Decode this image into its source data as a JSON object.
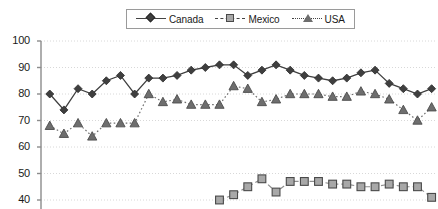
{
  "legend": {
    "position": "top-center",
    "border_color": "#9a9a9a",
    "entries": [
      {
        "label": "Canada",
        "marker": "diamond-marker",
        "line_style": "solid",
        "color": "#3f3f3f"
      },
      {
        "label": "Mexico",
        "marker": "square-marker",
        "line_style": "dashed",
        "color": "#a8a8a8"
      },
      {
        "label": "USA",
        "marker": "triangle-marker",
        "line_style": "dotted",
        "color": "#6e6e6e"
      }
    ]
  },
  "axis": {
    "y_ticks": [
      "100",
      "90",
      "80",
      "70",
      "60",
      "50",
      "40"
    ],
    "y_min": 40,
    "y_max": 100,
    "grid": true,
    "grid_style": "dotted",
    "grid_color": "#d8d8d8",
    "axis_color": "#8c8c8c"
  },
  "chart_data": {
    "type": "line",
    "title": "",
    "xlabel": "",
    "ylabel": "",
    "ylim": [
      40,
      100
    ],
    "grid": true,
    "legend_position": "top-center",
    "x": [
      1,
      2,
      3,
      4,
      5,
      6,
      7,
      8,
      9,
      10,
      11,
      12,
      13,
      14,
      15,
      16,
      17,
      18,
      19,
      20,
      21,
      22,
      23,
      24,
      25,
      26,
      27,
      28
    ],
    "series": [
      {
        "name": "Canada",
        "marker": "diamond",
        "line_style": "solid",
        "color": "#3f3f3f",
        "values": [
          80,
          74,
          82,
          80,
          85,
          87,
          80,
          86,
          86,
          87,
          89,
          90,
          91,
          91,
          87,
          89,
          91,
          89,
          87,
          86,
          85,
          86,
          88,
          89,
          84,
          82,
          80,
          82
        ]
      },
      {
        "name": "Mexico",
        "marker": "square",
        "line_style": "dashed",
        "color": "#a8a8a8",
        "values": [
          null,
          null,
          null,
          null,
          null,
          null,
          null,
          null,
          null,
          null,
          null,
          null,
          40,
          42,
          45,
          48,
          43,
          47,
          47,
          47,
          46,
          46,
          45,
          45,
          46,
          45,
          45,
          41
        ]
      },
      {
        "name": "USA",
        "marker": "triangle",
        "line_style": "dotted",
        "color": "#6e6e6e",
        "values": [
          68,
          65,
          69,
          64,
          69,
          69,
          69,
          80,
          77,
          78,
          76,
          76,
          76,
          83,
          82,
          77,
          78,
          80,
          80,
          80,
          79,
          79,
          81,
          80,
          78,
          74,
          70,
          75
        ]
      }
    ]
  }
}
